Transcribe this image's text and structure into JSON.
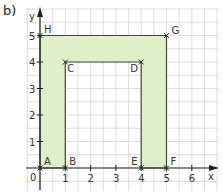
{
  "part_label": "b)",
  "axes": {
    "x_label": "x",
    "y_label": "y",
    "origin_label": "0",
    "x_ticks": [
      "1",
      "2",
      "3",
      "4",
      "5",
      "6"
    ],
    "y_ticks": [
      "1",
      "2",
      "3",
      "4",
      "5"
    ]
  },
  "colors": {
    "fill": "#dff0c8",
    "outline": "#3d4a3a",
    "grid": "#d4d4d4",
    "axis": "#222222"
  },
  "shape": {
    "name": "U-shaped polygon ABCDEFGH",
    "points": [
      {
        "label": "A",
        "x": 0,
        "y": 0
      },
      {
        "label": "B",
        "x": 1,
        "y": 0
      },
      {
        "label": "C",
        "x": 1,
        "y": 4
      },
      {
        "label": "D",
        "x": 4,
        "y": 4
      },
      {
        "label": "E",
        "x": 4,
        "y": 0
      },
      {
        "label": "F",
        "x": 5,
        "y": 0
      },
      {
        "label": "G",
        "x": 5,
        "y": 5
      },
      {
        "label": "H",
        "x": 0,
        "y": 5
      }
    ]
  }
}
